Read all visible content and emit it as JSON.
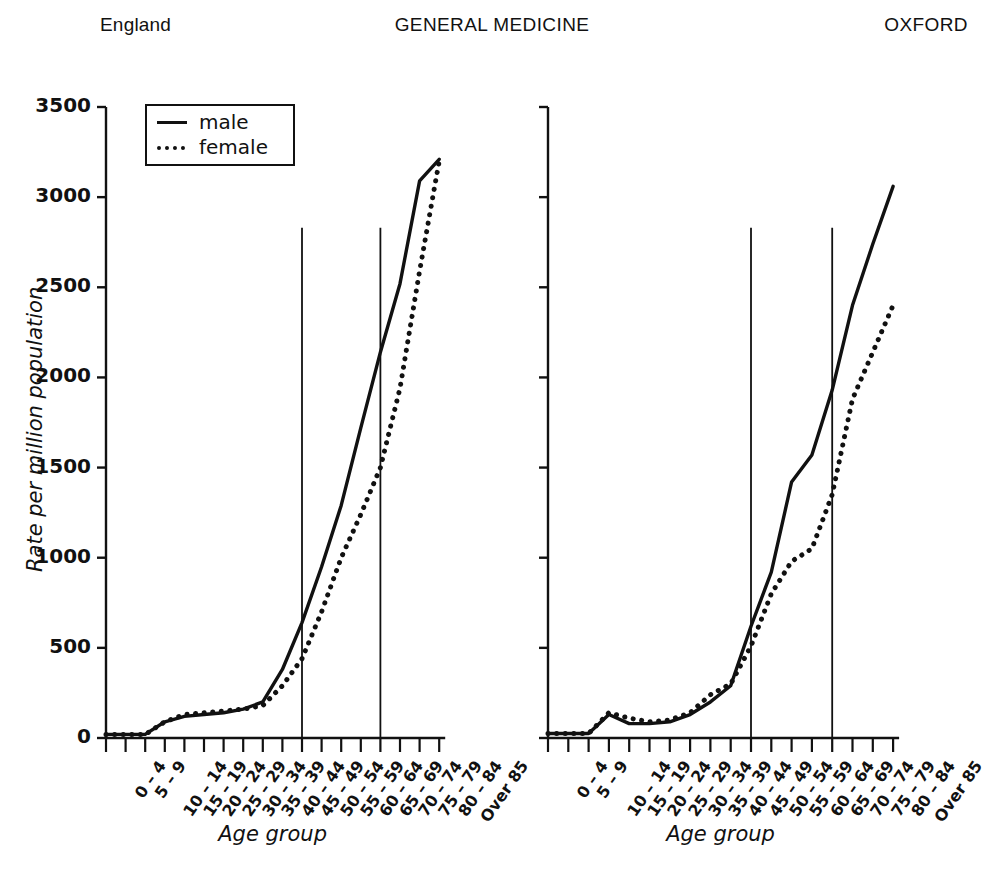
{
  "header": {
    "left": "England",
    "center": "GENERAL MEDICINE",
    "right": "OXFORD"
  },
  "legend": {
    "male_label": "male",
    "female_label": "female",
    "male_key": "solid-line-icon",
    "female_key": "dotted-line-icon",
    "position": "top-left-inside-left-panel"
  },
  "panels": {
    "left": {
      "name": "England",
      "xlabel": "Age group",
      "ylabel": "Rate per million population"
    },
    "right": {
      "name": "OXFORD",
      "xlabel": "Age group",
      "ylabel": "Rate per million population"
    }
  },
  "chart_data": [
    {
      "id": "england",
      "type": "line",
      "title": "England",
      "supertitle": "GENERAL MEDICINE",
      "xlabel": "Age group",
      "ylabel": "Rate per million population",
      "ylim": [
        0,
        3500
      ],
      "yticks": [
        0,
        500,
        1000,
        1500,
        2000,
        2500,
        3000,
        3500
      ],
      "grid": false,
      "legend": [
        "male",
        "female"
      ],
      "legend_position": "upper left",
      "annotations": [
        {
          "type": "vertical-reference-line",
          "at_category": "50 – 54",
          "y_top": 2830,
          "y_bottom": 0
        },
        {
          "type": "vertical-reference-line",
          "at_category": "70 – 74",
          "y_top": 2830,
          "y_bottom": 0
        }
      ],
      "categories": [
        "0 – 4",
        "5 – 9",
        "10 – 14",
        "15 – 19",
        "20 – 24",
        "25 – 29",
        "30 – 34",
        "35 – 39",
        "40 – 44",
        "45 – 49",
        "50 – 54",
        "55 – 59",
        "60 – 64",
        "65 – 69",
        "70 – 74",
        "75 – 79",
        "80 – 84",
        "Over 85"
      ],
      "series": [
        {
          "name": "male",
          "style": "solid",
          "values": [
            20,
            20,
            20,
            90,
            120,
            130,
            140,
            160,
            200,
            380,
            640,
            950,
            1290,
            1720,
            2140,
            2520,
            3090,
            3210
          ]
        },
        {
          "name": "female",
          "style": "dotted",
          "values": [
            20,
            20,
            20,
            90,
            130,
            140,
            150,
            160,
            180,
            290,
            440,
            700,
            1000,
            1240,
            1500,
            1940,
            2590,
            3200
          ]
        }
      ]
    },
    {
      "id": "oxford",
      "type": "line",
      "title": "OXFORD",
      "supertitle": "GENERAL MEDICINE",
      "xlabel": "Age group",
      "ylabel": "Rate per million population",
      "ylim": [
        0,
        3500
      ],
      "yticks": [
        0,
        500,
        1000,
        1500,
        2000,
        2500,
        3000,
        3500
      ],
      "grid": false,
      "legend": [
        "male",
        "female"
      ],
      "annotations": [
        {
          "type": "vertical-reference-line",
          "at_category": "50 – 54",
          "y_top": 2830,
          "y_bottom": 0
        },
        {
          "type": "vertical-reference-line",
          "at_category": "70 – 74",
          "y_top": 2830,
          "y_bottom": 0
        }
      ],
      "categories": [
        "0 – 4",
        "5 – 9",
        "10 – 14",
        "15 – 19",
        "20 – 24",
        "25 – 29",
        "30 – 34",
        "35 – 39",
        "40 – 44",
        "45 – 49",
        "50 – 54",
        "55 – 59",
        "60 – 64",
        "65 – 69",
        "70 – 74",
        "75 – 79",
        "80 – 84",
        "Over 85"
      ],
      "series": [
        {
          "name": "male",
          "style": "solid",
          "values": [
            25,
            25,
            25,
            130,
            80,
            80,
            90,
            130,
            200,
            290,
            620,
            920,
            1420,
            1570,
            1930,
            2400,
            2740,
            3060
          ]
        },
        {
          "name": "female",
          "style": "dotted",
          "values": [
            25,
            25,
            25,
            140,
            110,
            90,
            100,
            140,
            240,
            300,
            510,
            800,
            980,
            1050,
            1350,
            1880,
            2140,
            2400
          ]
        }
      ]
    }
  ]
}
